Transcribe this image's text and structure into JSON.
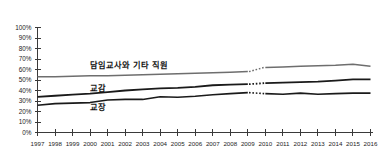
{
  "chart_data": {
    "type": "line",
    "title": "",
    "subtitle": "",
    "xlabel": "",
    "ylabel": "",
    "grid": false,
    "legend_position": "inline-labels",
    "x": [
      1997,
      1998,
      1999,
      2000,
      2001,
      2002,
      2003,
      2004,
      2005,
      2006,
      2007,
      2008,
      2009,
      2010,
      2011,
      2012,
      2013,
      2014,
      2015,
      2016
    ],
    "categories": [
      "1997",
      "1998",
      "1999",
      "2000",
      "2001",
      "2002",
      "2003",
      "2004",
      "2005",
      "2006",
      "2007",
      "2008",
      "2009",
      "2010",
      "2011",
      "2012",
      "2013",
      "2014",
      "2015",
      "2016"
    ],
    "xlim": [
      1997,
      2016
    ],
    "ylim": [
      0,
      100
    ],
    "ytick_labels": [
      "100%",
      "90%",
      "80%",
      "70%",
      "60%",
      "50%",
      "40%",
      "30%",
      "20%",
      "10%",
      "0%"
    ],
    "ytick_values": [
      100,
      90,
      80,
      70,
      60,
      50,
      40,
      30,
      20,
      10,
      0
    ],
    "series_break_between": [
      2009,
      2010
    ],
    "series": [
      {
        "name": "담임교사와 기타 직원",
        "label": "담임교사와 기타 직원",
        "color": "#6e6e6e",
        "stroke_width": 1.5,
        "label_x": 2000.0,
        "label_y": 61,
        "values": [
          53,
          53,
          53.5,
          54,
          54,
          54.5,
          55,
          55.5,
          56,
          56.5,
          57,
          57.5,
          58,
          62,
          62.5,
          63,
          63.5,
          64,
          65,
          63
        ]
      },
      {
        "name": "교감",
        "label": "교감",
        "color": "#1a1a1a",
        "stroke_width": 1.8,
        "label_x": 2000.0,
        "label_y": 40,
        "values": [
          34,
          35,
          36,
          37,
          38.5,
          40,
          41,
          42,
          42.5,
          43.5,
          45,
          45.5,
          46,
          47,
          47.5,
          48,
          48.5,
          49.5,
          50.5,
          50.5
        ]
      },
      {
        "name": "교장",
        "label": "교장",
        "color": "#1a1a1a",
        "stroke_width": 1.6,
        "label_x": 2000.0,
        "label_y": 21,
        "values": [
          26,
          27.5,
          28,
          28.5,
          31,
          31.5,
          31.5,
          34,
          33.5,
          34.5,
          36,
          37,
          38,
          37,
          36.5,
          37.5,
          36.5,
          37,
          37.5,
          37.5
        ]
      }
    ]
  },
  "colors": {
    "axis": "#3a3a3a",
    "text": "#1c1c1c",
    "background": "#ffffff",
    "series_gray": "#6e6e6e",
    "series_dark": "#1a1a1a"
  }
}
